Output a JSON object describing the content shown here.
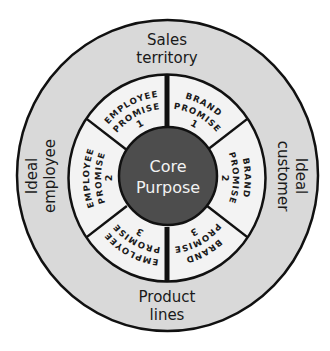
{
  "diagram": {
    "colors": {
      "background": "#ffffff",
      "outer_ring_fill": "#d9d9d9",
      "segment_fill": "#f3f3f3",
      "core_fill": "#4d4d4d",
      "stroke": "#111111",
      "core_text": "#f2f2f2"
    },
    "core": {
      "line1": "Core",
      "line2": "Purpose"
    },
    "outer_ring": {
      "top": {
        "line1": "Sales",
        "line2": "territory"
      },
      "right": {
        "line1": "Ideal",
        "line2": "customer"
      },
      "bottom": {
        "line1": "Product",
        "line2": "lines"
      },
      "left": {
        "line1": "Ideal",
        "line2": "employee"
      }
    },
    "segments": [
      {
        "id": "brand-promise-1",
        "start_deg": 0,
        "end_deg": 55,
        "lines": [
          "BRAND",
          "PROMISE",
          "1"
        ]
      },
      {
        "id": "brand-promise-2",
        "start_deg": 55,
        "end_deg": 125,
        "lines": [
          "BRAND",
          "PROMISE",
          "2"
        ]
      },
      {
        "id": "brand-promise-3",
        "start_deg": 125,
        "end_deg": 180,
        "lines": [
          "BRAND",
          "PROMISE",
          "3"
        ]
      },
      {
        "id": "employee-promise-3",
        "start_deg": 180,
        "end_deg": 235,
        "lines": [
          "EMPLOYEE",
          "PROMISE",
          "3"
        ]
      },
      {
        "id": "employee-promise-2",
        "start_deg": 235,
        "end_deg": 305,
        "lines": [
          "EMPLOYEE",
          "PROMISE",
          "2"
        ]
      },
      {
        "id": "employee-promise-1",
        "start_deg": 305,
        "end_deg": 360,
        "lines": [
          "EMPLOYEE",
          "PROMISE",
          "1"
        ]
      }
    ]
  }
}
